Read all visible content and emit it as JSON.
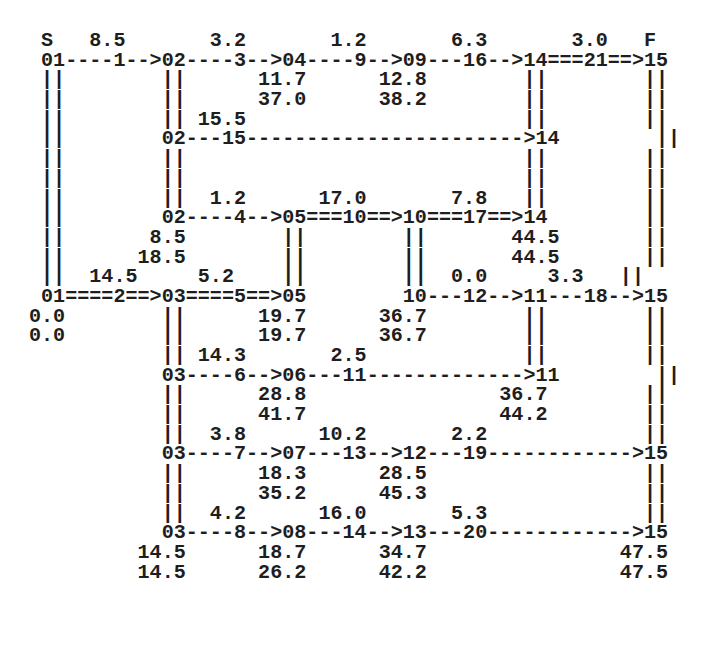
{
  "diagram": {
    "type": "activity-network (arrow diagram)",
    "start_label": "S",
    "finish_label": "F",
    "lines": [
      " S   8.5       3.2       1.2       6.3       3.0   F",
      " 01----1-->02----3-->04----9-->09---16-->14===21==>15",
      " ||        ||      11.7      12.8        ||        ||",
      " ||        ||      37.0      38.2        ||        ||",
      " ||        || 15.5                       ||        ||",
      " ||        02---15----------------------->14        ||",
      " ||        ||                            ||        ||",
      " ||        ||                            ||        ||",
      " ||        ||  1.2      17.0       7.8   ||        ||",
      " ||        02----4-->05===10==>10===17==>14        ||",
      " ||       8.5        ||        ||       44.5       ||",
      " ||      18.5        ||        ||       44.5       ||",
      " ||  14.5     5.2    ||        ||  0.0     3.3   ||",
      " 01====2==>03====5==>05        10---12-->11---18-->15",
      "0.0        ||      19.7      36.7        ||        ||",
      "0.0        ||      19.7      36.7        ||        ||",
      "           || 14.3       2.5             ||        ||",
      "           03----6-->06---11------------->11        ||",
      "           ||      28.8                36.7        ||",
      "           ||      41.7                44.2        ||",
      "           ||  3.8      10.2       2.2             ||",
      "           03----7-->07---13-->12---19------------>15",
      "           ||      18.3      28.5                  ||",
      "           ||      35.2      45.3                  ||",
      "           ||  4.2      16.0       5.3             ||",
      "           03----8-->08---14-->13---20------------>15",
      "         14.5      18.7      34.7                47.5",
      "         14.5      26.2      42.2                47.5"
    ],
    "nodes": [
      {
        "id": "01",
        "times": [
          "0.0",
          "0.0"
        ]
      },
      {
        "id": "02"
      },
      {
        "id": "03",
        "times": [
          "14.5",
          "14.5"
        ]
      },
      {
        "id": "04",
        "times": [
          "11.7",
          "37.0"
        ]
      },
      {
        "id": "05",
        "times": [
          "19.7",
          "19.7"
        ]
      },
      {
        "id": "06",
        "times": [
          "28.8",
          "41.7"
        ]
      },
      {
        "id": "07",
        "times": [
          "18.3",
          "35.2"
        ]
      },
      {
        "id": "08",
        "times": [
          "18.7",
          "26.2"
        ]
      },
      {
        "id": "09",
        "times": [
          "12.8",
          "38.2"
        ]
      },
      {
        "id": "10",
        "times": [
          "36.7",
          "36.7"
        ]
      },
      {
        "id": "11",
        "times": [
          "36.7",
          "44.2"
        ]
      },
      {
        "id": "12",
        "times": [
          "28.5",
          "45.3"
        ]
      },
      {
        "id": "13",
        "times": [
          "34.7",
          "42.2"
        ]
      },
      {
        "id": "14",
        "times": [
          "44.5",
          "44.5"
        ]
      },
      {
        "id": "15",
        "times": [
          "47.5",
          "47.5"
        ]
      }
    ],
    "activities": [
      {
        "id": "1",
        "from": "01",
        "to": "02",
        "duration": "8.5",
        "critical": false
      },
      {
        "id": "2",
        "from": "01",
        "to": "03",
        "duration": "14.5",
        "critical": true
      },
      {
        "id": "3",
        "from": "02",
        "to": "04",
        "duration": "3.2",
        "critical": false
      },
      {
        "id": "4",
        "from": "02",
        "to": "05",
        "duration": "1.2",
        "critical": false
      },
      {
        "id": "5",
        "from": "03",
        "to": "05",
        "duration": "5.2",
        "critical": true
      },
      {
        "id": "6",
        "from": "03",
        "to": "06",
        "duration": "14.3",
        "critical": false
      },
      {
        "id": "7",
        "from": "03",
        "to": "07",
        "duration": "3.8",
        "critical": false
      },
      {
        "id": "8",
        "from": "03",
        "to": "08",
        "duration": "4.2",
        "critical": false
      },
      {
        "id": "9",
        "from": "04",
        "to": "09",
        "duration": "1.2",
        "critical": false
      },
      {
        "id": "10",
        "from": "05",
        "to": "10",
        "duration": "17.0",
        "critical": true
      },
      {
        "id": "11",
        "from": "06",
        "to": "11",
        "duration": "2.5",
        "critical": false
      },
      {
        "id": "12",
        "from": "10",
        "to": "11",
        "duration": "0.0",
        "critical": false
      },
      {
        "id": "13",
        "from": "07",
        "to": "12",
        "duration": "10.2",
        "critical": false
      },
      {
        "id": "14",
        "from": "08",
        "to": "13",
        "duration": "16.0",
        "critical": false
      },
      {
        "id": "15",
        "from": "02",
        "to": "14",
        "duration": "15.5",
        "critical": false
      },
      {
        "id": "16",
        "from": "09",
        "to": "14",
        "duration": "6.3",
        "critical": false
      },
      {
        "id": "17",
        "from": "10",
        "to": "14",
        "duration": "7.8",
        "critical": true
      },
      {
        "id": "18",
        "from": "11",
        "to": "15",
        "duration": "3.3",
        "critical": false
      },
      {
        "id": "19",
        "from": "12",
        "to": "15",
        "duration": "2.2",
        "critical": false
      },
      {
        "id": "20",
        "from": "13",
        "to": "15",
        "duration": "5.3",
        "critical": false
      },
      {
        "id": "21",
        "from": "14",
        "to": "15",
        "duration": "3.0",
        "critical": true
      }
    ],
    "colors": {
      "text": "#1e1e1e",
      "background": "#ffffff"
    }
  }
}
